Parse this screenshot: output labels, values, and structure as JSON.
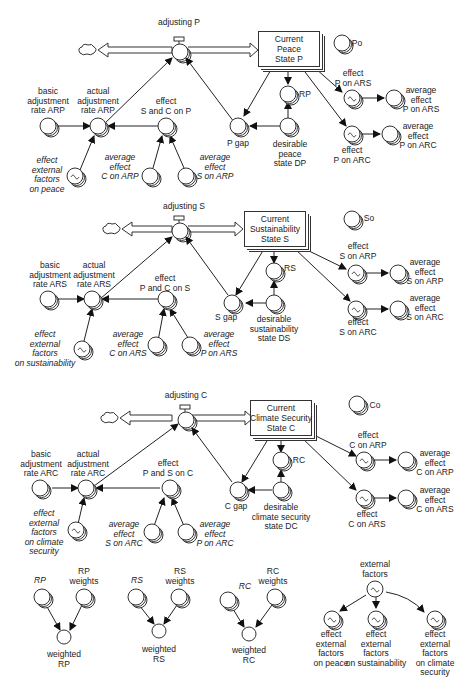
{
  "diagram": {
    "type": "stock-and-flow",
    "sectors": [
      {
        "id": "peace",
        "flow": "adjusting P",
        "stock": "Current\nPeace\nState P",
        "initial": "Po",
        "reference": "RP",
        "gap": "P gap",
        "desirable": "desirable\npeace\nstate DP",
        "basic_rate": "basic\nadjustment\nrate ARP",
        "actual_rate": "actual\nadjustment\nrate ARP",
        "combined_effect": "effect\nS and C on P",
        "ext_effect": "effect\nexternal\nfactors\non peace",
        "avg_in_1": "average\neffect\nC on ARP",
        "avg_in_2": "average\neffect\nS on ARP",
        "effect_out_1": "effect\nP on ARS",
        "effect_out_2": "effect\nP on ARC",
        "avg_out_1": "average\neffect\nP on ARS",
        "avg_out_2": "average\neffect\nP on ARC"
      },
      {
        "id": "sustainability",
        "flow": "adjusting S",
        "stock": "Current\nSustainability\nState S",
        "initial": "So",
        "reference": "RS",
        "gap": "S gap",
        "desirable": "desirable\nsustainability\nstate DS",
        "basic_rate": "basic\nadjustment\nrate ARS",
        "actual_rate": "actual\nadjustment\nrate ARS",
        "combined_effect": "effect\nP and C on S",
        "ext_effect": "effect\nexternal\nfactors\non sustainability",
        "avg_in_1": "average\neffect\nC on ARS",
        "avg_in_2": "average\neffect\nP on ARS",
        "effect_out_1": "effect\nS on ARP",
        "effect_out_2": "effect\nS on ARC",
        "avg_out_1": "average\neffect\nS on ARP",
        "avg_out_2": "average\neffect\nS on ARC"
      },
      {
        "id": "climate",
        "flow": "adjusting C",
        "stock": "Current\nClimate Security\nState C",
        "initial": "Co",
        "reference": "RC",
        "gap": "C gap",
        "desirable": "desirable\nclimate security\nstate DC",
        "basic_rate": "basic\nadjustment\nrate ARC",
        "actual_rate": "actual\nadjustment\nrate ARC",
        "combined_effect": "effect\nP and S on C",
        "ext_effect": "effect\nexternal\nfactors\non climate\nsecurity",
        "avg_in_1": "average\neffect\nS on ARC",
        "avg_in_2": "average\neffect\nP on ARC",
        "effect_out_1": "effect\nC on ARP",
        "effect_out_2": "effect\nC on ARS",
        "avg_out_1": "average\neffect\nC on ARP",
        "avg_out_2": "average\neffect\nC on ARS"
      }
    ],
    "weighting": [
      {
        "in": "RP",
        "weights": "RP\nweights",
        "out": "weighted\nRP"
      },
      {
        "in": "RS",
        "weights": "RS\nweights",
        "out": "weighted\nRS"
      },
      {
        "in": "RC",
        "weights": "RC\nweights",
        "out": "weighted\nRC"
      }
    ],
    "external": {
      "source": "external\nfactors",
      "targets": [
        "effect\nexternal\nfactors\non peace",
        "effect\nexternal\nfactors\non sustainability",
        "effect\nexternal\nfactors\non climate\nsecurity"
      ]
    },
    "colors": {
      "line": "#222222",
      "background": "#ffffff"
    }
  }
}
